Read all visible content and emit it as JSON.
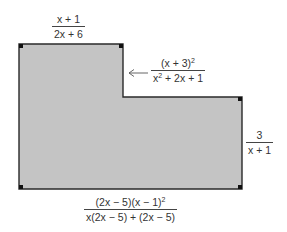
{
  "diagram": {
    "type": "L-shaped polygon with labeled sides",
    "fill_color": "#c4c4c4",
    "stroke_color": "#2a2a2a",
    "vertices": [
      [
        19,
        44
      ],
      [
        123,
        44
      ],
      [
        123,
        97
      ],
      [
        242,
        97
      ],
      [
        242,
        189
      ],
      [
        19,
        189
      ]
    ],
    "labels": {
      "top": {
        "numerator": "x + 1",
        "denominator": "2x + 6"
      },
      "notch": {
        "numerator_base": "(x + 3)",
        "numerator_exp": "2",
        "denominator_pre": "x",
        "denominator_exp": "2",
        "denominator_post": " + 2x + 1",
        "pointer": "arrow-left"
      },
      "right": {
        "numerator": "3",
        "denominator": "x + 1"
      },
      "bottom": {
        "numerator_main": "(2x − 5)(x − 1)",
        "numerator_exp": "2",
        "denominator": "x(2x − 5) + (2x − 5)"
      }
    }
  }
}
